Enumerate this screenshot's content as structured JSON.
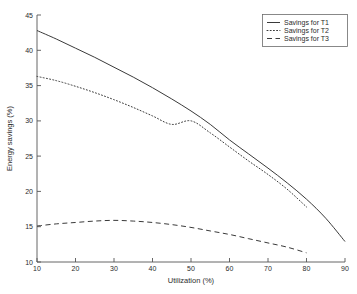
{
  "chart_data": {
    "type": "line",
    "title": "",
    "xlabel": "Utilization (%)",
    "ylabel": "Energy savings (%)",
    "xlim": [
      10,
      90
    ],
    "ylim": [
      10,
      45
    ],
    "xticks": [
      10,
      20,
      30,
      40,
      50,
      60,
      70,
      80,
      90
    ],
    "yticks": [
      10,
      15,
      20,
      25,
      30,
      35,
      40,
      45
    ],
    "xtick_labels": [
      "10",
      "20",
      "30",
      "40",
      "50",
      "60",
      "70",
      "80",
      "90"
    ],
    "ytick_labels": [
      "10",
      "15",
      "20",
      "25",
      "30",
      "35",
      "40",
      "45"
    ],
    "grid": false,
    "legend_position": "top-right",
    "series": [
      {
        "name": "Savings for T1",
        "style": "solid",
        "color": "#3a3a3a",
        "x": [
          10,
          15,
          20,
          25,
          30,
          35,
          40,
          45,
          50,
          55,
          60,
          65,
          70,
          75,
          80,
          85,
          90
        ],
        "y": [
          42.8,
          41.6,
          40.3,
          39.0,
          37.6,
          36.2,
          34.7,
          33.1,
          31.4,
          29.5,
          27.3,
          25.3,
          23.3,
          21.2,
          18.9,
          16.2,
          12.9
        ]
      },
      {
        "name": "Savings for T2",
        "style": "dotted",
        "color": "#3a3a3a",
        "x": [
          10,
          15,
          20,
          25,
          30,
          35,
          40,
          45,
          50,
          55,
          60,
          65,
          70,
          75,
          80
        ],
        "y": [
          36.3,
          35.7,
          34.9,
          34.0,
          33.0,
          31.9,
          30.7,
          29.5,
          30.0,
          28.3,
          26.3,
          24.3,
          22.4,
          20.3,
          17.8
        ]
      },
      {
        "name": "Savings for T3",
        "style": "dashed",
        "color": "#3a3a3a",
        "x": [
          10,
          15,
          20,
          25,
          30,
          35,
          40,
          45,
          50,
          55,
          60,
          65,
          70,
          75,
          80
        ],
        "y": [
          15.1,
          15.4,
          15.6,
          15.8,
          15.9,
          15.8,
          15.6,
          15.3,
          14.9,
          14.4,
          13.9,
          13.3,
          12.7,
          12.1,
          11.3
        ]
      }
    ]
  },
  "legend": {
    "entries": [
      {
        "label": "Savings for T1"
      },
      {
        "label": "Savings for T2"
      },
      {
        "label": "Savings for T3"
      }
    ]
  },
  "axes": {
    "x_title": "Utilization (%)",
    "y_title": "Energy savings (%)",
    "x_tick_labels": [
      "10",
      "20",
      "30",
      "40",
      "50",
      "60",
      "70",
      "80",
      "90"
    ],
    "y_tick_labels": [
      "10",
      "15",
      "20",
      "25",
      "30",
      "35",
      "40",
      "45"
    ]
  },
  "colors": {
    "background": "#ffffff",
    "axis": "#555555",
    "line": "#3a3a3a",
    "text": "#2b2b2b"
  }
}
